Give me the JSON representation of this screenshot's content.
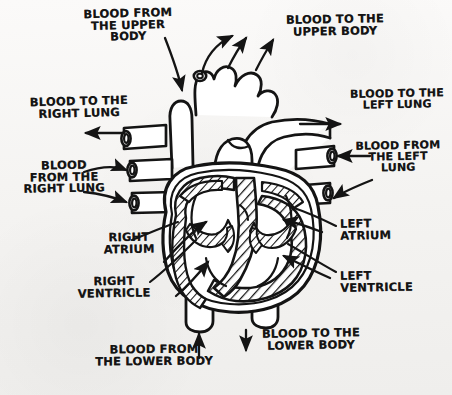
{
  "diagram": {
    "style": "hand-drawn ink sketch on paper",
    "ink_color": "#141414",
    "paper_color": "#f7f6f4"
  },
  "labels": [
    {
      "id": "blood-from-upper-body",
      "text": "BLOOD FROM\nTHE UPPER\nBODY",
      "x": 74,
      "y": 8,
      "w": 108,
      "align": "c",
      "rot": -1.5,
      "size": 11.5
    },
    {
      "id": "blood-to-upper-body",
      "text": "BLOOD TO THE\nUPPER BODY",
      "x": 276,
      "y": 14,
      "w": 118,
      "align": "c",
      "rot": -1,
      "size": 11.5
    },
    {
      "id": "blood-to-right-lung",
      "text": "BLOOD TO THE\nRIGHT LUNG",
      "x": 22,
      "y": 96,
      "w": 114,
      "align": "c",
      "rot": -1.5,
      "size": 11.5
    },
    {
      "id": "blood-to-left-lung",
      "text": "BLOOD TO THE\nLEFT LUNG",
      "x": 344,
      "y": 88,
      "w": 106,
      "align": "c",
      "rot": -1,
      "size": 11
    },
    {
      "id": "blood-from-left-lung",
      "text": "BLOOD FROM\nTHE LEFT\nLUNG",
      "x": 346,
      "y": 140,
      "w": 104,
      "align": "c",
      "rot": -1,
      "size": 11
    },
    {
      "id": "blood-from-right-lung",
      "text": "BLOOD\nFROM THE\nRIGHT LUNG",
      "x": 10,
      "y": 160,
      "w": 108,
      "align": "c",
      "rot": -1,
      "size": 11.5
    },
    {
      "id": "right-atrium",
      "text": "RIGHT\nATRIUM",
      "x": 88,
      "y": 232,
      "w": 82,
      "align": "c",
      "rot": -1,
      "size": 11.5
    },
    {
      "id": "left-atrium",
      "text": "LEFT\nATRIUM",
      "x": 340,
      "y": 218,
      "w": 80,
      "align": "l",
      "rot": -1,
      "size": 11.5
    },
    {
      "id": "right-ventricle",
      "text": "RIGHT\nVENTRICLE",
      "x": 62,
      "y": 276,
      "w": 104,
      "align": "c",
      "rot": -1,
      "size": 11.5
    },
    {
      "id": "left-ventricle",
      "text": "LEFT\nVENTRICLE",
      "x": 340,
      "y": 270,
      "w": 100,
      "align": "l",
      "rot": -1,
      "size": 11.5
    },
    {
      "id": "blood-from-lower-body",
      "text": "BLOOD FROM\nTHE LOWER BODY",
      "x": 82,
      "y": 344,
      "w": 144,
      "align": "c",
      "rot": -0.5,
      "size": 11.5
    },
    {
      "id": "blood-to-lower-body",
      "text": "BLOOD TO THE\nLOWER BODY",
      "x": 252,
      "y": 328,
      "w": 118,
      "align": "c",
      "rot": -1,
      "size": 11.5
    }
  ],
  "anatomy": {
    "chambers": [
      "right atrium",
      "left atrium",
      "right ventricle",
      "left ventricle"
    ],
    "vessels": [
      "superior vena cava",
      "inferior vena cava",
      "aortic arch",
      "descending aorta",
      "pulmonary artery (right branch)",
      "pulmonary artery (left branch)",
      "right pulmonary veins",
      "left pulmonary veins",
      "brachiocephalic / carotid / subclavian branches"
    ]
  }
}
